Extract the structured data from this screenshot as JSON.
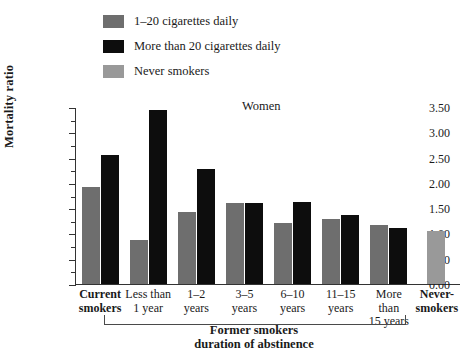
{
  "chart_data": {
    "type": "bar",
    "title": "",
    "annotation": "Women",
    "xlabel": "",
    "ylabel": "Mortality ratio",
    "ylim": [
      0.0,
      3.5
    ],
    "ytick_step": 0.5,
    "yminor_step": 0.25,
    "grid": false,
    "legend_position": "top-left",
    "categories": [
      "Current smokers",
      "Less than 1 year",
      "1–2 years",
      "3–5 years",
      "6–10 years",
      "11–15 years",
      "More than 15 years",
      "Never-smokers"
    ],
    "ytick_labels": [
      "0.00",
      "0.50",
      "1.00",
      "1.50",
      "2.00",
      "2.50",
      "3.00",
      "3.50"
    ],
    "series": [
      {
        "name": "1–20 cigarettes daily",
        "color": "#6e6e6e",
        "values": [
          1.92,
          0.87,
          1.42,
          1.6,
          1.21,
          1.28,
          1.17,
          null
        ]
      },
      {
        "name": "More than 20 cigarettes daily",
        "color": "#0d0d0d",
        "values": [
          2.55,
          3.45,
          2.27,
          1.6,
          1.62,
          1.36,
          1.11,
          null
        ]
      },
      {
        "name": "Never smokers",
        "color": "#999999",
        "values": [
          null,
          null,
          null,
          null,
          null,
          null,
          null,
          1.05
        ]
      }
    ],
    "group_bracket": {
      "label_line1": "Former smokers",
      "label_line2": "duration of abstinence",
      "spans_categories": [
        1,
        6
      ]
    }
  },
  "legend": {
    "items": [
      {
        "label": "1–20 cigarettes daily",
        "color": "#6e6e6e"
      },
      {
        "label": "More than 20 cigarettes daily",
        "color": "#0d0d0d"
      },
      {
        "label": "Never smokers",
        "color": "#999999"
      }
    ]
  },
  "xlabels": [
    {
      "lines": [
        "Current",
        "smokers"
      ],
      "bold": true
    },
    {
      "lines": [
        "Less than",
        "1 year"
      ],
      "bold": false
    },
    {
      "lines": [
        "1–2",
        "years"
      ],
      "bold": false
    },
    {
      "lines": [
        "3–5",
        "years"
      ],
      "bold": false
    },
    {
      "lines": [
        "6–10",
        "years"
      ],
      "bold": false
    },
    {
      "lines": [
        "11–15",
        "years"
      ],
      "bold": false
    },
    {
      "lines": [
        "More than",
        "15 years"
      ],
      "bold": false
    },
    {
      "lines": [
        "Never-",
        "smokers"
      ],
      "bold": true
    }
  ],
  "colors": {
    "axis": "#333333",
    "bracket": "#4a4a4a",
    "background": "#ffffff",
    "text": "#1a1a1a"
  }
}
